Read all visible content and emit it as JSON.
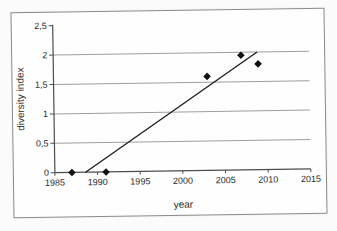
{
  "chart_data": {
    "type": "scatter",
    "title": "",
    "xlabel": "year",
    "ylabel": "diversity index",
    "xlim": [
      1985,
      2015
    ],
    "ylim": [
      0,
      2.5
    ],
    "grid": "horizontal",
    "legend": "none",
    "decimal_separator": ",",
    "x_ticks": [
      {
        "v": 1985,
        "label": "1985"
      },
      {
        "v": 1990,
        "label": "1990"
      },
      {
        "v": 1995,
        "label": "1995"
      },
      {
        "v": 2000,
        "label": "2000"
      },
      {
        "v": 2005,
        "label": "2005"
      },
      {
        "v": 2010,
        "label": "2010"
      },
      {
        "v": 2015,
        "label": "2015"
      }
    ],
    "y_ticks": [
      {
        "v": 0,
        "label": "0"
      },
      {
        "v": 0.5,
        "label": "0,5"
      },
      {
        "v": 1,
        "label": "1"
      },
      {
        "v": 1.5,
        "label": "1,5"
      },
      {
        "v": 2,
        "label": "2"
      },
      {
        "v": 2.5,
        "label": "2,5"
      }
    ],
    "gridlines": [
      0.5,
      1,
      1.5,
      2
    ],
    "series": [
      {
        "name": "diversity index",
        "marker": "diamond",
        "points": [
          {
            "x": 1987,
            "y": 0
          },
          {
            "x": 1991,
            "y": 0
          },
          {
            "x": 2003,
            "y": 1.6
          },
          {
            "x": 2007,
            "y": 1.95
          },
          {
            "x": 2009,
            "y": 1.8
          }
        ]
      }
    ],
    "trendline": {
      "x1": 1988.6,
      "y1": 0,
      "x2": 2008.9,
      "y2": 2.0
    },
    "colors": {
      "marker": "#111111",
      "trendline": "#1a1a1a",
      "gridline": "#9e9e9e",
      "axis": "#4d4d4d",
      "text": "#2b2b2b",
      "frame_border": "#8a8a8a",
      "background": "#fefefe"
    }
  }
}
